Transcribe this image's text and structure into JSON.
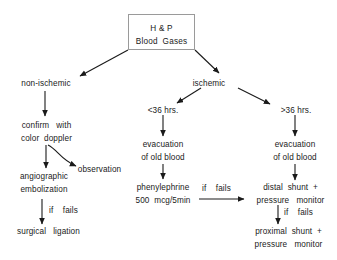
{
  "diagram": {
    "background_color": "#ffffff",
    "text_color": "#1a1a1a",
    "box_border_color": "#9a9a9a",
    "arrow_color": "#1a1a1a",
    "root": {
      "line1": "H & P",
      "line2": "Blood  Gases"
    },
    "branches": {
      "non_ischemic": "non-ischemic",
      "ischemic": "ischemic",
      "under_36": "<36 hrs.",
      "over_36": ">36 hrs."
    },
    "nodes": {
      "confirm": {
        "line1": "confirm   with",
        "line2": "color  doppler"
      },
      "observation": {
        "line1": "observation"
      },
      "angiographic": {
        "line1": "angiographic",
        "line2": "embolization"
      },
      "surgical": {
        "line1": "surgical   ligation"
      },
      "evacuation_mid": {
        "line1": "evacuation",
        "line2": "of old blood"
      },
      "phenylephrine": {
        "line1": "phenylephrine",
        "line2": "500  mcg/5min"
      },
      "evacuation_right": {
        "line1": "evacuation",
        "line2": "of old blood"
      },
      "distal_shunt": {
        "line1": "distal  shunt  +",
        "line2": "pressure   monitor"
      },
      "proximal_shunt": {
        "line1": "proximal  shunt  +",
        "line2": "pressure   monitor"
      }
    },
    "edge_labels": {
      "if_fails_angio": "if    fails",
      "if_fails_phenyl": "if    fails",
      "if_fails_distal": "if    fails"
    }
  }
}
